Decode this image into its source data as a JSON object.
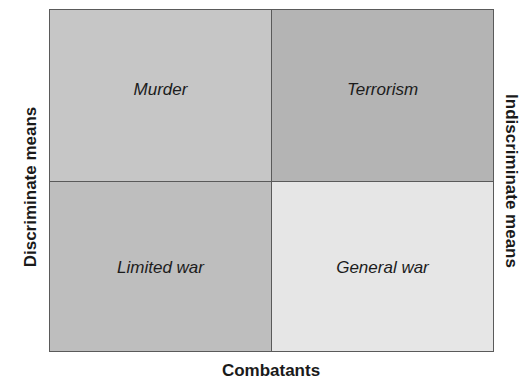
{
  "diagram": {
    "type": "2x2-matrix",
    "axes": {
      "left_label": "Discriminate means",
      "right_label": "Indiscriminate means",
      "bottom_label": "Combatants"
    },
    "quadrants": [
      {
        "position": "top-left",
        "label": "Murder",
        "fill": "#c6c6c6"
      },
      {
        "position": "top-right",
        "label": "Terrorism",
        "fill": "#b4b4b4"
      },
      {
        "position": "bottom-left",
        "label": "Limited war",
        "fill": "#bebebe"
      },
      {
        "position": "bottom-right",
        "label": "General war",
        "fill": "#e6e6e6"
      }
    ],
    "border_color": "#5a5a5a"
  }
}
